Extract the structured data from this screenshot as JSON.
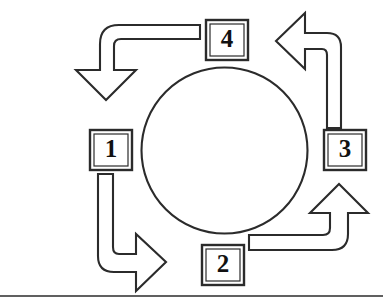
{
  "figure": {
    "type": "cycle-diagram",
    "title": "",
    "orientation": "counterclockwise",
    "colors": {
      "stroke": "#2b2b2b",
      "fill": "#ffffff",
      "background": "#ffffff",
      "label_text": "#111111"
    },
    "center_circle": {
      "label": "",
      "cx": 224.5,
      "cy": 150.5,
      "r": 83
    },
    "steps": [
      {
        "id": "step-1",
        "number": "1",
        "position": "left",
        "box": {
          "x": 90,
          "y": 130,
          "width": 42,
          "height": 40
        }
      },
      {
        "id": "step-2",
        "number": "2",
        "position": "bottom",
        "box": {
          "x": 202,
          "y": 245,
          "width": 42,
          "height": 40
        }
      },
      {
        "id": "step-3",
        "number": "3",
        "position": "right",
        "box": {
          "x": 324,
          "y": 130,
          "width": 42,
          "height": 40
        }
      },
      {
        "id": "step-4",
        "number": "4",
        "position": "top",
        "box": {
          "x": 206,
          "y": 20,
          "width": 42,
          "height": 40
        }
      }
    ],
    "arrows": [
      {
        "id": "arrow-1-to-2",
        "from": "1",
        "to": "2",
        "quadrant": "bottom-left",
        "direction": "down-then-right",
        "head_points": "right"
      },
      {
        "id": "arrow-2-to-3",
        "from": "2",
        "to": "3",
        "quadrant": "bottom-right",
        "direction": "right-then-up",
        "head_points": "up"
      },
      {
        "id": "arrow-3-to-4",
        "from": "3",
        "to": "4",
        "quadrant": "top-right",
        "direction": "up-then-left",
        "head_points": "left"
      },
      {
        "id": "arrow-4-to-1",
        "from": "4",
        "to": "1",
        "quadrant": "top-left",
        "direction": "left-then-down",
        "head_points": "down"
      }
    ],
    "baseline_rule": {
      "y": 296,
      "x1": 0,
      "x2": 383
    }
  }
}
